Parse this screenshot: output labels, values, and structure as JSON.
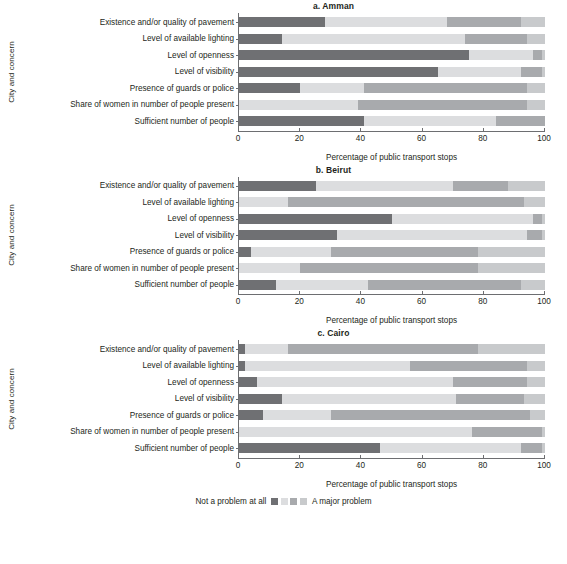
{
  "figure": {
    "yaxis_title": "City and concern",
    "xaxis_title": "Percentage of public transport stops",
    "legend": {
      "left_label": "Not a problem at all",
      "right_label": "A major problem",
      "swatch_colors": [
        "#6f7073",
        "#dcdddf",
        "#a8aaad",
        "#c8cacc"
      ]
    },
    "x_ticks": [
      "0",
      "20",
      "40",
      "60",
      "80",
      "100"
    ]
  },
  "chart_data": {
    "type": "bar",
    "subtype": "stacked-horizontal-100pct",
    "xlabel": "Percentage of public transport stops",
    "ylabel": "City and concern",
    "xlim": [
      0,
      100
    ],
    "xticks": [
      0,
      20,
      40,
      60,
      80,
      100
    ],
    "grid": false,
    "legend_position": "bottom-center",
    "legend_entries": [
      "Not a problem at all",
      "Minor problem",
      "Moderate problem",
      "A major problem"
    ],
    "colors": [
      "#6f7073",
      "#dcdddf",
      "#a8aaad",
      "#c8cacc"
    ],
    "categories": [
      "Existence and/or quality of pavement",
      "Level of available lighting",
      "Level of openness",
      "Level of visibility",
      "Presence of guards or police",
      "Share of women in number of people present",
      "Sufficient number of people"
    ],
    "panels": [
      {
        "id": "a",
        "title": "a. Amman",
        "rows": [
          {
            "category": "Existence and/or quality of pavement",
            "values": [
              28,
              40,
              24,
              8
            ]
          },
          {
            "category": "Level of available lighting",
            "values": [
              14,
              60,
              20,
              6
            ]
          },
          {
            "category": "Level of openness",
            "values": [
              75,
              21,
              3,
              1
            ]
          },
          {
            "category": "Level of visibility",
            "values": [
              65,
              27,
              7,
              1
            ]
          },
          {
            "category": "Presence of guards or police",
            "values": [
              20,
              21,
              53,
              6
            ]
          },
          {
            "category": "Share of women in number of people present",
            "values": [
              0,
              39,
              55,
              6
            ]
          },
          {
            "category": "Sufficient number of people",
            "values": [
              41,
              43,
              16,
              0
            ]
          }
        ]
      },
      {
        "id": "b",
        "title": "b. Beirut",
        "rows": [
          {
            "category": "Existence and/or quality of pavement",
            "values": [
              25,
              45,
              18,
              12
            ]
          },
          {
            "category": "Level of available lighting",
            "values": [
              0,
              16,
              77,
              7
            ]
          },
          {
            "category": "Level of openness",
            "values": [
              50,
              46,
              3,
              1
            ]
          },
          {
            "category": "Level of visibility",
            "values": [
              32,
              62,
              5,
              1
            ]
          },
          {
            "category": "Presence of guards or police",
            "values": [
              4,
              26,
              48,
              22
            ]
          },
          {
            "category": "Share of women in number of people present",
            "values": [
              0,
              20,
              58,
              22
            ]
          },
          {
            "category": "Sufficient number of people",
            "values": [
              12,
              30,
              50,
              8
            ]
          }
        ]
      },
      {
        "id": "c",
        "title": "c. Cairo",
        "rows": [
          {
            "category": "Existence and/or quality of pavement",
            "values": [
              2,
              14,
              62,
              22
            ]
          },
          {
            "category": "Level of available lighting",
            "values": [
              2,
              54,
              38,
              6
            ]
          },
          {
            "category": "Level of openness",
            "values": [
              6,
              64,
              24,
              6
            ]
          },
          {
            "category": "Level of visibility",
            "values": [
              14,
              57,
              22,
              7
            ]
          },
          {
            "category": "Presence of guards or police",
            "values": [
              8,
              22,
              65,
              5
            ]
          },
          {
            "category": "Share of women in number of people present",
            "values": [
              0,
              76,
              23,
              1
            ]
          },
          {
            "category": "Sufficient number of people",
            "values": [
              46,
              46,
              7,
              1
            ]
          }
        ]
      }
    ]
  }
}
